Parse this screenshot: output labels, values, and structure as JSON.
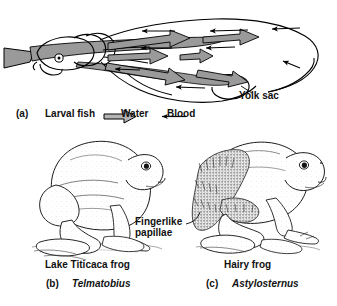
{
  "figure": {
    "background_color": "#ffffff",
    "ink_color": "#000000",
    "water_arrow_color": "#9a9a9a"
  },
  "panel_a": {
    "letter": "(a)",
    "caption": "Larval fish",
    "annotation": "Yolk sac",
    "legend": [
      {
        "icon": "block-arrow-right-icon",
        "label": "Water",
        "color": "#9a9a9a",
        "direction": "right"
      },
      {
        "icon": "line-arrow-left-icon",
        "label": "Blood",
        "color": "#000000",
        "direction": "left"
      }
    ],
    "water_arrow_count": 6,
    "blood_arrow_count": 7
  },
  "panel_b": {
    "letter": "(b)",
    "common_name": "Lake Titicaca frog",
    "genus": "Telmatobius"
  },
  "panel_c": {
    "letter": "(c)",
    "common_name": "Hairy frog",
    "genus": "Astylosternus",
    "annotation_line1": "Fingerlike",
    "annotation_line2": "papillae"
  }
}
